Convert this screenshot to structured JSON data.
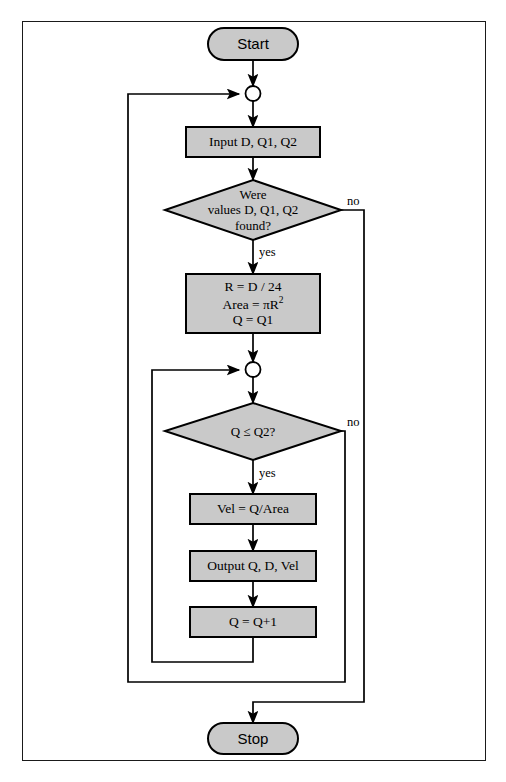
{
  "diagram": {
    "kind": "flowchart",
    "title": "",
    "colors": {
      "shape_fill": "#c9c9c9",
      "shape_stroke": "#000000",
      "connector_fill": "#ffffff",
      "line": "#000000",
      "frame": "#1a1a1a",
      "text": "#000000",
      "background": "#ffffff"
    },
    "nodes": {
      "start": {
        "type": "terminator",
        "label": "Start"
      },
      "connector_outer": {
        "type": "connector",
        "label": ""
      },
      "input": {
        "type": "process",
        "label": "Input D, Q1, Q2"
      },
      "decision_found": {
        "type": "decision",
        "line1": "Were",
        "line2": "values D, Q1, Q2",
        "line3": "found?"
      },
      "compute": {
        "type": "process",
        "line1": "R = D / 24",
        "line2_pre": "Area = ",
        "line2_pi": "πR",
        "line2_sup": "2",
        "line3": "Q = Q1"
      },
      "connector_inner": {
        "type": "connector",
        "label": ""
      },
      "decision_loop": {
        "type": "decision",
        "label": "Q ≤ Q2?"
      },
      "velocity": {
        "type": "process",
        "label": "Vel = Q/Area"
      },
      "output": {
        "type": "process",
        "label": "Output Q, D, Vel"
      },
      "increment": {
        "type": "process",
        "label": "Q = Q+1"
      },
      "stop": {
        "type": "terminator",
        "label": "Stop"
      }
    },
    "edge_labels": {
      "found_no": "no",
      "found_yes": "yes",
      "loop_no": "no",
      "loop_yes": "yes"
    }
  }
}
